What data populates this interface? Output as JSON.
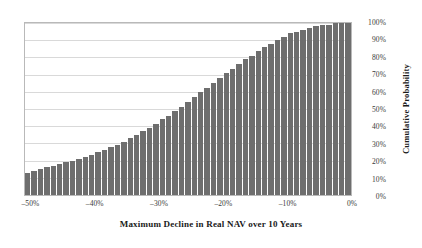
{
  "chart_data": {
    "type": "bar",
    "title": "",
    "xlabel": "Maximum Decline in Real NAV over 10 Years",
    "ylabel": "Cumulative Probability",
    "xlim": [
      -51,
      0
    ],
    "ylim": [
      0,
      100
    ],
    "grid": true,
    "legend": false,
    "bar_color": "#6e6e6e",
    "x_tick_labels": [
      "–50%",
      "–40%",
      "–30%",
      "–20%",
      "–10%",
      "0%"
    ],
    "x_tick_values": [
      -50,
      -40,
      -30,
      -20,
      -10,
      0
    ],
    "y_tick_labels": [
      "0%",
      "10%",
      "20%",
      "30%",
      "40%",
      "50%",
      "60%",
      "70%",
      "80%",
      "90%",
      "100%"
    ],
    "y_tick_values": [
      0,
      10,
      20,
      30,
      40,
      50,
      60,
      70,
      80,
      90,
      100
    ],
    "categories": [
      "–50%",
      "–49%",
      "–48%",
      "–47%",
      "–46%",
      "–45%",
      "–44%",
      "–43%",
      "–42%",
      "–41%",
      "–40%",
      "–39%",
      "–38%",
      "–37%",
      "–36%",
      "–35%",
      "–34%",
      "–33%",
      "–32%",
      "–31%",
      "–30%",
      "–29%",
      "–28%",
      "–27%",
      "–26%",
      "–25%",
      "–24%",
      "–23%",
      "–22%",
      "–21%",
      "–20%",
      "–19%",
      "–18%",
      "–17%",
      "–16%",
      "–15%",
      "–14%",
      "–13%",
      "–12%",
      "–11%",
      "–10%",
      "–9%",
      "–8%",
      "–7%",
      "–6%",
      "–5%",
      "–4%",
      "–3%",
      "–2%",
      "–1%",
      "0%"
    ],
    "values": [
      13,
      14,
      15,
      16,
      17,
      18,
      19,
      20,
      21,
      22,
      23,
      25,
      26,
      28,
      29,
      31,
      33,
      35,
      37,
      39,
      41,
      44,
      46,
      49,
      51,
      54,
      57,
      60,
      62,
      65,
      68,
      71,
      73,
      76,
      79,
      81,
      84,
      86,
      88,
      90,
      92,
      94,
      95,
      96,
      97,
      98,
      99,
      99,
      100,
      100,
      100
    ]
  }
}
